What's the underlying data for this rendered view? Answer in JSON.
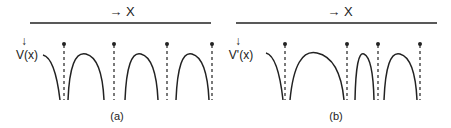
{
  "panels": [
    {
      "id": "a",
      "axis_label": "→ X",
      "y_arrow": "↓",
      "y_label": "V(x)",
      "caption": "(a)"
    },
    {
      "id": "b",
      "axis_label": "→ X",
      "y_arrow": "↓",
      "y_label": "V'(x)",
      "caption": "(b)"
    }
  ],
  "colors": {
    "stroke": "#222222"
  }
}
